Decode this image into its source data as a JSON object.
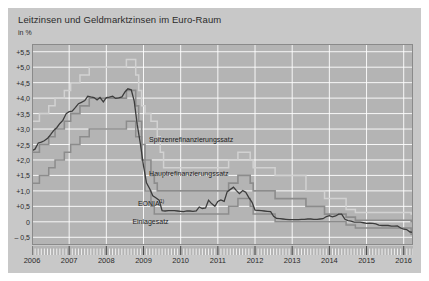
{
  "header": {
    "title": "Leitzinsen und Geldmarktzinsen im Euro-Raum",
    "unit": "in %"
  },
  "labels": {
    "spitzen": "Spitzenrefinanzierungssatz",
    "haupt": "Hauptrefinanzierungssatz",
    "eonia": "EONIA",
    "eonia_footnote": "1)",
    "einlage": "Einlagesatz"
  },
  "colors": {
    "plot_background": "#b4b4b4",
    "figure_background": "#c8c8c8",
    "gridline": "#ffffff",
    "spitzen": "#d2d2d2",
    "haupt": "#8c8c8c",
    "eonia": "#3c3c3c",
    "einlage": "#8c8c8c",
    "text": "#2b2b2b"
  },
  "chart_data": {
    "type": "line",
    "title": "Leitzinsen und Geldmarktzinsen im Euro-Raum",
    "subtitle": "in %",
    "xlabel": "",
    "ylabel": "in %",
    "ylim": [
      -0.75,
      5.75
    ],
    "xlim": [
      2006.0,
      2016.25
    ],
    "grid": true,
    "legend": "inline-annotations",
    "yticks": [
      5.5,
      5.0,
      4.5,
      4.0,
      3.5,
      3.0,
      2.5,
      2.0,
      1.5,
      1.0,
      0.5,
      0.0,
      -0.5
    ],
    "ytick_labels": [
      "+5,5",
      "+5,0",
      "+4,5",
      "+4,0",
      "+3,5",
      "+3,0",
      "+2,5",
      "+2,0",
      "+1,5",
      "+1,0",
      "+0,5",
      "0",
      "– 0,5"
    ],
    "xticks": [
      2006,
      2007,
      2008,
      2009,
      2010,
      2011,
      2012,
      2013,
      2014,
      2015,
      2016
    ],
    "xtick_labels": [
      "2006",
      "2007",
      "2008",
      "2009",
      "2010",
      "2011",
      "2012",
      "2013",
      "2014",
      "2015",
      "2016"
    ],
    "minor_xticks_per_year": 12,
    "series": [
      {
        "name": "Spitzenrefinanzierungssatz",
        "style": "step",
        "color": "#d2d2d2",
        "points": [
          [
            2006.0,
            3.25
          ],
          [
            2006.2,
            3.5
          ],
          [
            2006.45,
            3.75
          ],
          [
            2006.62,
            4.0
          ],
          [
            2006.87,
            4.25
          ],
          [
            2007.04,
            4.5
          ],
          [
            2007.29,
            4.75
          ],
          [
            2007.54,
            5.0
          ],
          [
            2007.75,
            5.0
          ],
          [
            2008.0,
            5.0
          ],
          [
            2008.54,
            5.25
          ],
          [
            2008.79,
            4.75
          ],
          [
            2008.87,
            4.25
          ],
          [
            2008.95,
            3.75
          ],
          [
            2009.04,
            3.5
          ],
          [
            2009.2,
            3.25
          ],
          [
            2009.29,
            3.25
          ],
          [
            2009.37,
            2.75
          ],
          [
            2009.45,
            2.25
          ],
          [
            2009.54,
            1.75
          ],
          [
            2010.0,
            1.75
          ],
          [
            2011.0,
            1.75
          ],
          [
            2011.29,
            2.0
          ],
          [
            2011.54,
            2.25
          ],
          [
            2011.87,
            2.0
          ],
          [
            2011.95,
            1.75
          ],
          [
            2012.54,
            1.5
          ],
          [
            2013.37,
            1.0
          ],
          [
            2013.87,
            0.75
          ],
          [
            2014.45,
            0.4
          ],
          [
            2014.7,
            0.3
          ],
          [
            2015.0,
            0.3
          ],
          [
            2016.0,
            0.3
          ],
          [
            2016.2,
            0.25
          ]
        ]
      },
      {
        "name": "Hauptrefinanzierungssatz",
        "style": "step",
        "color": "#8c8c8c",
        "points": [
          [
            2006.0,
            2.25
          ],
          [
            2006.2,
            2.5
          ],
          [
            2006.45,
            2.75
          ],
          [
            2006.62,
            3.0
          ],
          [
            2006.87,
            3.25
          ],
          [
            2007.04,
            3.5
          ],
          [
            2007.29,
            3.75
          ],
          [
            2007.54,
            4.0
          ],
          [
            2007.75,
            4.0
          ],
          [
            2008.0,
            4.0
          ],
          [
            2008.54,
            4.25
          ],
          [
            2008.79,
            3.75
          ],
          [
            2008.87,
            3.25
          ],
          [
            2008.95,
            2.5
          ],
          [
            2009.04,
            2.0
          ],
          [
            2009.2,
            1.5
          ],
          [
            2009.29,
            1.25
          ],
          [
            2009.37,
            1.0
          ],
          [
            2010.0,
            1.0
          ],
          [
            2011.0,
            1.0
          ],
          [
            2011.29,
            1.25
          ],
          [
            2011.54,
            1.5
          ],
          [
            2011.87,
            1.25
          ],
          [
            2011.95,
            1.0
          ],
          [
            2012.54,
            0.75
          ],
          [
            2013.37,
            0.5
          ],
          [
            2013.87,
            0.25
          ],
          [
            2014.45,
            0.15
          ],
          [
            2014.7,
            0.05
          ],
          [
            2015.0,
            0.05
          ],
          [
            2016.0,
            0.05
          ],
          [
            2016.2,
            0.0
          ]
        ]
      },
      {
        "name": "Einlagesatz",
        "style": "step",
        "color": "#8c8c8c",
        "points": [
          [
            2006.0,
            1.25
          ],
          [
            2006.2,
            1.5
          ],
          [
            2006.45,
            1.75
          ],
          [
            2006.62,
            2.0
          ],
          [
            2006.87,
            2.25
          ],
          [
            2007.04,
            2.5
          ],
          [
            2007.29,
            2.75
          ],
          [
            2007.54,
            3.0
          ],
          [
            2007.75,
            3.0
          ],
          [
            2008.0,
            3.0
          ],
          [
            2008.54,
            3.25
          ],
          [
            2008.79,
            2.75
          ],
          [
            2008.87,
            2.75
          ],
          [
            2008.95,
            2.0
          ],
          [
            2009.04,
            1.0
          ],
          [
            2009.2,
            0.5
          ],
          [
            2009.29,
            0.25
          ],
          [
            2009.37,
            0.25
          ],
          [
            2010.0,
            0.25
          ],
          [
            2011.0,
            0.25
          ],
          [
            2011.29,
            0.5
          ],
          [
            2011.54,
            0.75
          ],
          [
            2011.87,
            0.5
          ],
          [
            2011.95,
            0.25
          ],
          [
            2012.54,
            0.0
          ],
          [
            2013.37,
            0.0
          ],
          [
            2013.87,
            0.0
          ],
          [
            2014.45,
            -0.1
          ],
          [
            2014.7,
            -0.2
          ],
          [
            2015.0,
            -0.2
          ],
          [
            2015.95,
            -0.2
          ],
          [
            2016.2,
            -0.4
          ]
        ]
      },
      {
        "name": "EONIA",
        "style": "line",
        "color": "#3c3c3c",
        "points": [
          [
            2006.0,
            2.3
          ],
          [
            2006.08,
            2.35
          ],
          [
            2006.17,
            2.55
          ],
          [
            2006.25,
            2.58
          ],
          [
            2006.33,
            2.62
          ],
          [
            2006.42,
            2.7
          ],
          [
            2006.5,
            2.82
          ],
          [
            2006.58,
            2.95
          ],
          [
            2006.67,
            3.05
          ],
          [
            2006.75,
            3.18
          ],
          [
            2006.83,
            3.28
          ],
          [
            2006.92,
            3.5
          ],
          [
            2007.0,
            3.56
          ],
          [
            2007.08,
            3.58
          ],
          [
            2007.17,
            3.7
          ],
          [
            2007.25,
            3.82
          ],
          [
            2007.33,
            3.86
          ],
          [
            2007.42,
            3.92
          ],
          [
            2007.5,
            4.06
          ],
          [
            2007.58,
            4.04
          ],
          [
            2007.67,
            4.02
          ],
          [
            2007.75,
            3.94
          ],
          [
            2007.83,
            4.02
          ],
          [
            2007.92,
            3.88
          ],
          [
            2008.0,
            4.02
          ],
          [
            2008.08,
            4.03
          ],
          [
            2008.17,
            4.06
          ],
          [
            2008.25,
            3.99
          ],
          [
            2008.33,
            4.01
          ],
          [
            2008.42,
            4.04
          ],
          [
            2008.5,
            4.2
          ],
          [
            2008.58,
            4.3
          ],
          [
            2008.67,
            4.27
          ],
          [
            2008.75,
            3.9
          ],
          [
            2008.83,
            3.15
          ],
          [
            2008.92,
            2.49
          ],
          [
            2009.0,
            1.81
          ],
          [
            2009.08,
            1.26
          ],
          [
            2009.17,
            1.06
          ],
          [
            2009.25,
            0.84
          ],
          [
            2009.33,
            0.78
          ],
          [
            2009.42,
            0.7
          ],
          [
            2009.5,
            0.36
          ],
          [
            2009.58,
            0.35
          ],
          [
            2009.67,
            0.36
          ],
          [
            2009.75,
            0.36
          ],
          [
            2009.83,
            0.36
          ],
          [
            2009.92,
            0.35
          ],
          [
            2010.0,
            0.34
          ],
          [
            2010.08,
            0.33
          ],
          [
            2010.17,
            0.35
          ],
          [
            2010.25,
            0.35
          ],
          [
            2010.33,
            0.34
          ],
          [
            2010.42,
            0.35
          ],
          [
            2010.5,
            0.48
          ],
          [
            2010.58,
            0.43
          ],
          [
            2010.67,
            0.45
          ],
          [
            2010.75,
            0.7
          ],
          [
            2010.83,
            0.59
          ],
          [
            2010.92,
            0.5
          ],
          [
            2011.0,
            0.66
          ],
          [
            2011.08,
            0.71
          ],
          [
            2011.17,
            0.66
          ],
          [
            2011.25,
            0.97
          ],
          [
            2011.33,
            1.04
          ],
          [
            2011.42,
            1.12
          ],
          [
            2011.5,
            1.01
          ],
          [
            2011.58,
            0.91
          ],
          [
            2011.67,
            1.01
          ],
          [
            2011.75,
            0.96
          ],
          [
            2011.83,
            0.79
          ],
          [
            2011.92,
            0.63
          ],
          [
            2012.0,
            0.38
          ],
          [
            2012.08,
            0.37
          ],
          [
            2012.17,
            0.36
          ],
          [
            2012.25,
            0.35
          ],
          [
            2012.33,
            0.34
          ],
          [
            2012.42,
            0.33
          ],
          [
            2012.5,
            0.18
          ],
          [
            2012.58,
            0.11
          ],
          [
            2012.67,
            0.1
          ],
          [
            2012.75,
            0.09
          ],
          [
            2012.83,
            0.08
          ],
          [
            2012.92,
            0.07
          ],
          [
            2013.0,
            0.07
          ],
          [
            2013.08,
            0.07
          ],
          [
            2013.17,
            0.07
          ],
          [
            2013.25,
            0.08
          ],
          [
            2013.33,
            0.08
          ],
          [
            2013.42,
            0.09
          ],
          [
            2013.5,
            0.09
          ],
          [
            2013.58,
            0.08
          ],
          [
            2013.67,
            0.08
          ],
          [
            2013.75,
            0.09
          ],
          [
            2013.83,
            0.1
          ],
          [
            2013.92,
            0.17
          ],
          [
            2014.0,
            0.2
          ],
          [
            2014.08,
            0.16
          ],
          [
            2014.17,
            0.19
          ],
          [
            2014.25,
            0.25
          ],
          [
            2014.33,
            0.25
          ],
          [
            2014.42,
            0.08
          ],
          [
            2014.5,
            0.04
          ],
          [
            2014.58,
            0.02
          ],
          [
            2014.67,
            -0.01
          ],
          [
            2014.75,
            -0.01
          ],
          [
            2014.83,
            -0.01
          ],
          [
            2014.92,
            -0.03
          ],
          [
            2015.0,
            -0.05
          ],
          [
            2015.08,
            -0.04
          ],
          [
            2015.17,
            -0.05
          ],
          [
            2015.25,
            -0.07
          ],
          [
            2015.33,
            -0.11
          ],
          [
            2015.42,
            -0.12
          ],
          [
            2015.5,
            -0.12
          ],
          [
            2015.58,
            -0.12
          ],
          [
            2015.67,
            -0.14
          ],
          [
            2015.75,
            -0.14
          ],
          [
            2015.83,
            -0.13
          ],
          [
            2015.92,
            -0.2
          ],
          [
            2016.0,
            -0.24
          ],
          [
            2016.08,
            -0.25
          ],
          [
            2016.17,
            -0.33
          ],
          [
            2016.25,
            -0.34
          ]
        ]
      }
    ],
    "annotations": [
      {
        "text": "Spitzenrefinanzierungssatz",
        "x": 2009.15,
        "y": 2.62
      },
      {
        "text": "Hauptrefinanzierungssatz",
        "x": 2009.15,
        "y": 1.52
      },
      {
        "text": "EONIA",
        "x": 2008.85,
        "y": 0.62
      },
      {
        "text": "Einlagesatz",
        "x": 2008.7,
        "y": -0.05
      }
    ]
  }
}
